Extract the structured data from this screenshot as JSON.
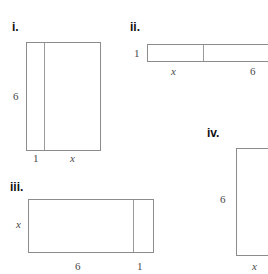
{
  "page": {
    "background_color": "#ffffff",
    "line_color": "#8c8c8c",
    "text_color": "#2b2b2b"
  },
  "figures": [
    {
      "id": "i",
      "label": "i.",
      "shape": "rectangle-with-vertical-divider",
      "dimensions": {
        "height_label": "6",
        "left_segment_label": "1",
        "right_segment_label": "x"
      }
    },
    {
      "id": "ii",
      "label": "ii.",
      "shape": "rectangle-with-vertical-divider",
      "dimensions": {
        "height_label": "1",
        "left_segment_label": "x",
        "right_segment_label": "6"
      }
    },
    {
      "id": "iii",
      "label": "iii.",
      "shape": "rectangle-with-vertical-divider",
      "dimensions": {
        "height_label": "x",
        "left_segment_label": "6",
        "right_segment_label": "1"
      }
    },
    {
      "id": "iv",
      "label": "iv.",
      "shape": "rectangle",
      "dimensions": {
        "height_label": "6",
        "bottom_label": "x"
      }
    }
  ]
}
